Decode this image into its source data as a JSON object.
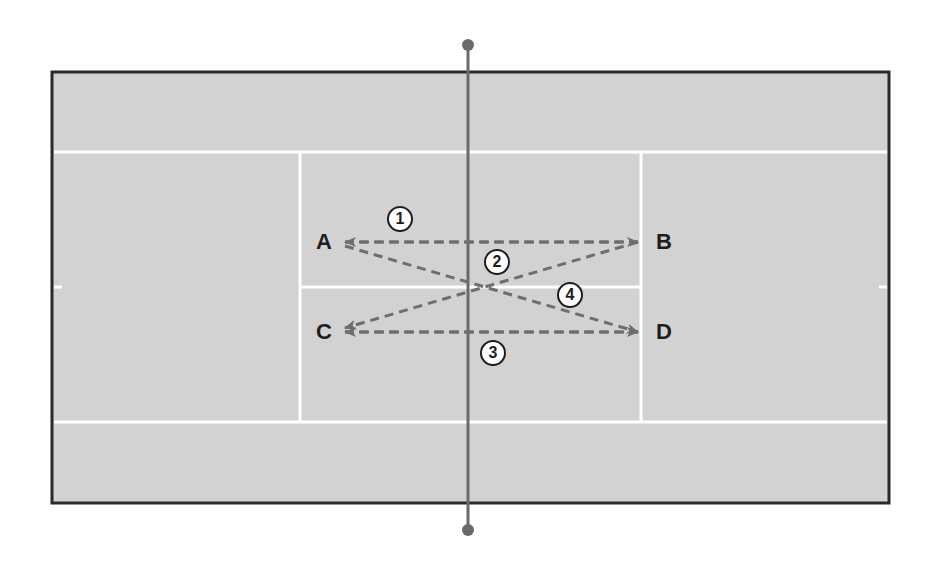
{
  "diagram": {
    "colors": {
      "court": "#d2d2d2",
      "lines": "#ffffff",
      "border": "#2a2a2a",
      "net": "#6a6a6a",
      "arrows": "#6e6e6e",
      "text": "#1e1e1e"
    },
    "positions": [
      {
        "id": "A",
        "label": "A"
      },
      {
        "id": "B",
        "label": "B"
      },
      {
        "id": "C",
        "label": "C"
      },
      {
        "id": "D",
        "label": "D"
      }
    ],
    "steps": [
      {
        "number": "1",
        "from": "B",
        "to": "A"
      },
      {
        "number": "2",
        "from": "D",
        "to": "C"
      },
      {
        "number": "3",
        "from": "C",
        "to": "D"
      },
      {
        "number": "4",
        "from": "A",
        "to": "D"
      }
    ]
  }
}
